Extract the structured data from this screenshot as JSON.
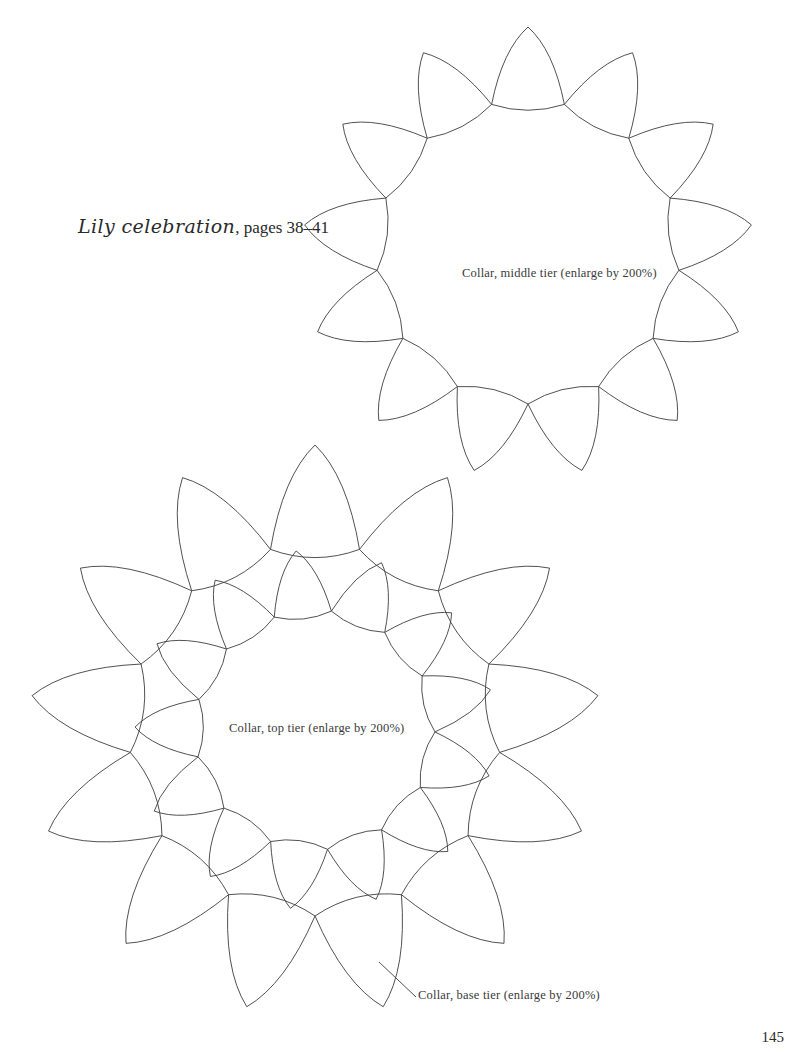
{
  "page": {
    "background_color": "#ffffff",
    "ink_color": "#3d3d3d",
    "page_number": "145",
    "width": 806,
    "height": 1060
  },
  "title": {
    "script_part": "Lily celebration",
    "rest_part": ", pages 38–41",
    "full": "Lily celebration, pages 38–41"
  },
  "labels": {
    "middle_tier": "Collar, middle tier (enlarge by 200%)",
    "top_tier": "Collar, top tier (enlarge by 200%)",
    "base_tier": "Collar, base tier (enlarge by 200%)"
  },
  "diagram": {
    "type": "line-art-pattern-template",
    "stroke_color": "#3d3d3d",
    "stroke_width": 0.9,
    "fill": "none",
    "rings": [
      {
        "name": "middle-tier-ring",
        "center_x": 528,
        "center_y": 252,
        "inner_radius": 152,
        "outer_radius": 225,
        "petal_count": 13,
        "start_angle_deg": -90
      },
      {
        "name": "top-tier-ring",
        "center_x": 315,
        "center_y": 730,
        "inner_radius": 120,
        "outer_radius": 180,
        "petal_count": 13,
        "start_angle_deg": -96
      },
      {
        "name": "base-tier-ring",
        "center_x": 315,
        "center_y": 730,
        "inner_radius": 186,
        "outer_radius": 285,
        "petal_count": 13,
        "start_angle_deg": -90
      }
    ],
    "leader_line": {
      "name": "base-tier-leader-line",
      "x1": 379,
      "y1": 962,
      "x2": 416,
      "y2": 997
    }
  }
}
